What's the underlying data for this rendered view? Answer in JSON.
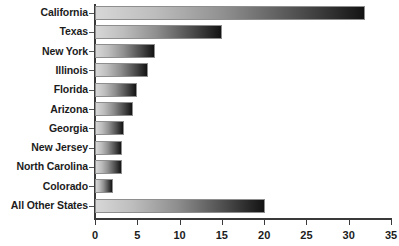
{
  "chart_data": {
    "type": "bar",
    "orientation": "horizontal",
    "title": "",
    "xlabel": "",
    "ylabel": "",
    "xlim": [
      0,
      35
    ],
    "xticks": [
      0,
      5,
      10,
      15,
      20,
      25,
      30,
      35
    ],
    "grid": false,
    "legend": null,
    "categories": [
      "California",
      "Texas",
      "New York",
      "Illinois",
      "Florida",
      "Arizona",
      "Georgia",
      "New Jersey",
      "North Carolina",
      "Colorado",
      "All Other States"
    ],
    "values": [
      31.9,
      15.0,
      7.1,
      6.3,
      5.0,
      4.5,
      3.4,
      3.2,
      3.2,
      2.1,
      20.1
    ]
  },
  "style": {
    "bar_gradient_start": "#d7d7d7",
    "bar_gradient_end": "#131313",
    "bar_border": "#8e8e8e",
    "axis_color": "#3a3a3a",
    "text_color": "#1c1c1c",
    "background": "#ffffff"
  }
}
